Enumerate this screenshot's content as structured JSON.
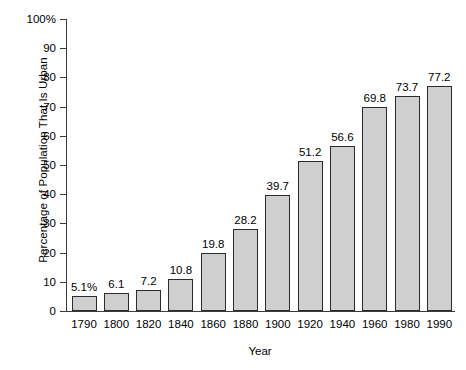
{
  "chart_data": {
    "type": "bar",
    "title": "",
    "xlabel": "Year",
    "ylabel": "Percentage of Population That Is Urban",
    "categories": [
      "1790",
      "1800",
      "1820",
      "1840",
      "1860",
      "1880",
      "1900",
      "1920",
      "1940",
      "1960",
      "1980",
      "1990"
    ],
    "values": [
      5.1,
      6.1,
      7.2,
      10.8,
      19.8,
      28.2,
      39.7,
      51.2,
      56.6,
      69.8,
      73.7,
      77.2
    ],
    "value_labels": [
      "5.1%",
      "6.1",
      "7.2",
      "10.8",
      "19.8",
      "28.2",
      "39.7",
      "51.2",
      "56.6",
      "69.8",
      "73.7",
      "77.2"
    ],
    "ylim": [
      0,
      100
    ],
    "ytick_values": [
      0,
      10,
      20,
      30,
      40,
      50,
      60,
      70,
      80,
      90,
      100
    ],
    "ytick_labels": [
      "0",
      "10",
      "20",
      "30",
      "40",
      "50",
      "60",
      "70",
      "80",
      "90",
      "100%"
    ],
    "grid": false,
    "legend": false,
    "bar_fill_color": "#cfcfcf",
    "bar_edge_color": "#2b2b2b",
    "axis_color": "#3a3a3a",
    "background_color": "#ffffff"
  }
}
